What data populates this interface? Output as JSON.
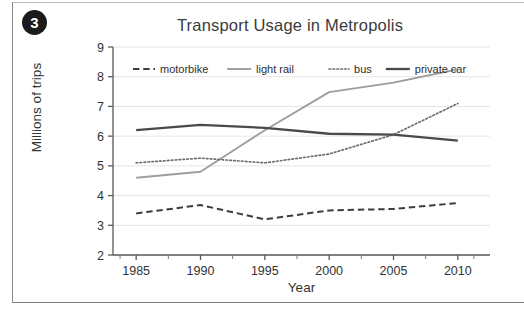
{
  "badge": {
    "number": "3"
  },
  "chart_data": {
    "type": "line",
    "title": "Transport Usage in Metropolis",
    "xlabel": "Year",
    "ylabel": "Millions of trips",
    "x": [
      1985,
      1990,
      1995,
      2000,
      2005,
      2010
    ],
    "xtick_labels": [
      "1985",
      "1990",
      "1995",
      "2000",
      "2005",
      "2010"
    ],
    "ytick_labels": [
      "2",
      "3",
      "4",
      "5",
      "6",
      "7",
      "8",
      "9"
    ],
    "xlim": [
      1983.2,
      2012.5
    ],
    "ylim": [
      2,
      9
    ],
    "grid": "horizontal",
    "legend_position": "top-inside",
    "series": [
      {
        "name": "motorbike",
        "values": [
          3.4,
          3.68,
          3.2,
          3.5,
          3.55,
          3.75
        ],
        "style": "dashed",
        "color": "#3d3d3d",
        "width": 2.0
      },
      {
        "name": "light rail",
        "values": [
          4.6,
          4.8,
          6.2,
          7.48,
          7.8,
          8.25
        ],
        "style": "solid",
        "color": "#9e9e9e",
        "width": 1.9
      },
      {
        "name": "bus",
        "values": [
          5.1,
          5.26,
          5.1,
          5.4,
          6.05,
          7.1
        ],
        "style": "dotted",
        "color": "#6e6e6e",
        "width": 1.7
      },
      {
        "name": "private car",
        "values": [
          6.2,
          6.38,
          6.28,
          6.08,
          6.05,
          5.85
        ],
        "style": "solid",
        "color": "#4a4a4a",
        "width": 2.3
      }
    ]
  }
}
